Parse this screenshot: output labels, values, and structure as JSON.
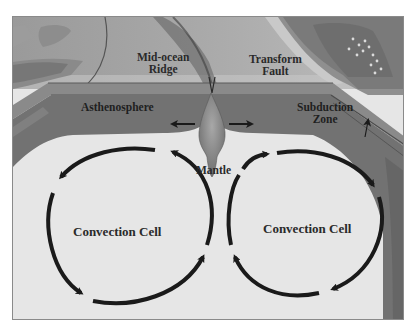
{
  "diagram": {
    "type": "cross-section",
    "labels": {
      "mid_ocean_ridge": "Mid-ocean\nRidge",
      "mid_ocean_ridge_line1": "Mid-ocean",
      "mid_ocean_ridge_line2": "Ridge",
      "transform_fault_line1": "Transform",
      "transform_fault_line2": "Fault",
      "asthenosphere": "Asthenosphere",
      "subduction_zone_line1": "Subduction",
      "subduction_zone_line2": "Zone",
      "mantle": "Mantle",
      "convection_cell_left": "Convection Cell",
      "convection_cell_right": "Convection Cell"
    },
    "arrows": {
      "asthenosphere_flow_left": "left",
      "asthenosphere_flow_right": "right",
      "left_cell_direction": "counterclockwise",
      "right_cell_direction": "clockwise"
    },
    "colors": {
      "background": "#e6e6e6",
      "ocean_surface": "#b9b9b9",
      "lithosphere": "#7d7d7d",
      "asthenosphere": "#6e6e6e",
      "mantle_plume": "#8c8c8c",
      "arrow": "#1a1a1a",
      "text": "#2a2a2a"
    }
  }
}
